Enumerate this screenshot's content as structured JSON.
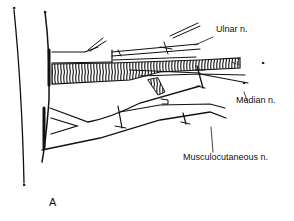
{
  "figure": {
    "panel_label": "A",
    "labels": {
      "ulnar": "Ulnar n.",
      "median": "Median n.",
      "musculocutaneous": "Musculocutaneous n."
    },
    "colors": {
      "ink": "#111111",
      "background": "#ffffff"
    }
  }
}
